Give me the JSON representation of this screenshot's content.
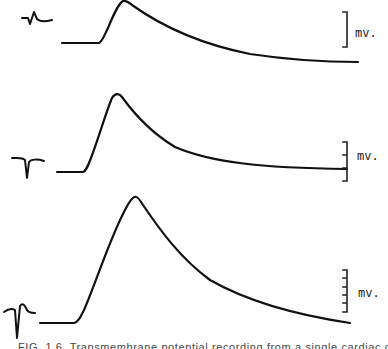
{
  "figure": {
    "caption": "FIG. 1.6.  Transmembrane potential recording from a single cardiac cell. (From",
    "traces": [
      {
        "id": "trace-1",
        "unit_label": "mv.",
        "scale_bar_segments": 1,
        "path": "M62,43 L99,43 C102,42 104,36 108,28 C113,16 118,4 123,1 C126,0 128,2 132,5 C160,25 200,44 250,54 C290,60 320,62 358,62",
        "glyph_path": "M22,18 L28,18 L30,24 L34,12 L37,19 C40,22 44,22 52,20"
      },
      {
        "id": "trace-2",
        "unit_label": "mv.",
        "scale_bar_segments": 3,
        "path": "M57,172 L83,172 C86,171 88,166 91,158 C98,140 106,112 112,98 C115,93 119,93 122,97 C135,115 150,132 175,147 C210,162 260,168 347,169",
        "glyph_path": "M12,158 C18,158 22,157 25,160 L27,178 L29,162 C31,159 38,159 44,161"
      },
      {
        "id": "trace-3",
        "unit_label": "mv.",
        "scale_bar_segments": 5,
        "path": "M40,323 L74,323 C78,322 80,318 84,310 C95,285 110,238 125,210 C129,202 133,196 136,197 C138,197 140,200 143,205 C160,230 180,258 210,280 C245,300 290,314 350,323",
        "glyph_path": "M4,312 C8,309 12,308 15,310 L17,338 L20,306 C22,303 24,304 26,308 C27,312 30,313 35,313"
      }
    ],
    "scale_bars": [
      {
        "x": 347,
        "y_top": 12,
        "y_bottom": 47,
        "label_x": 355,
        "label_y": 37
      },
      {
        "x": 347,
        "y_top": 142,
        "y_bottom": 181,
        "label_x": 357,
        "label_y": 160
      },
      {
        "x": 347,
        "y_top": 270,
        "y_bottom": 312,
        "label_x": 358,
        "label_y": 297
      }
    ]
  }
}
